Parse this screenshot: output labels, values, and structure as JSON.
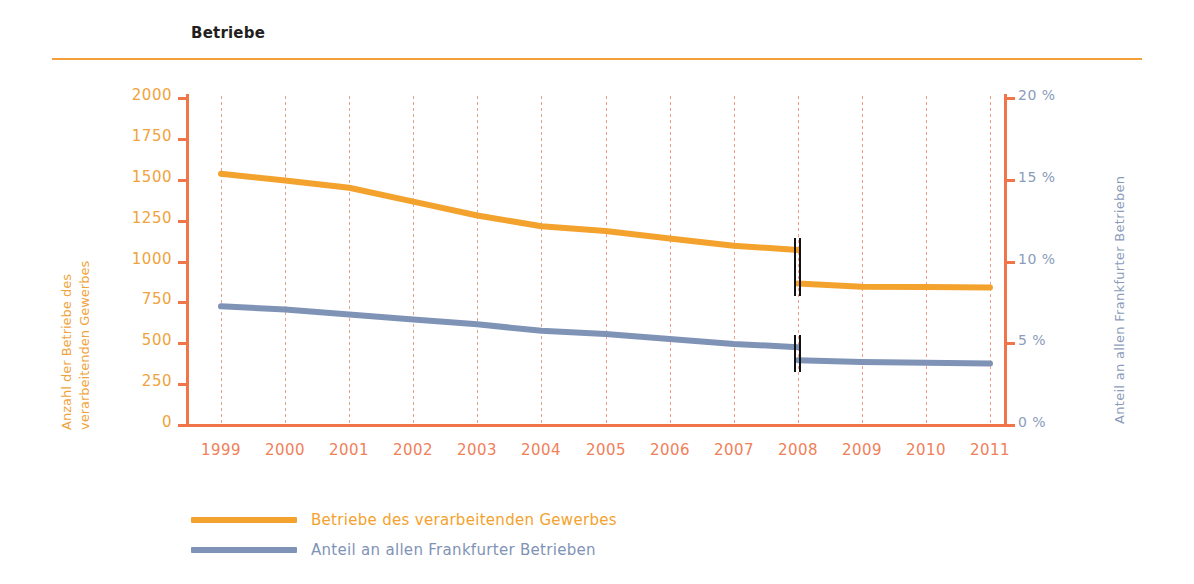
{
  "header": {
    "title": "Betriebe"
  },
  "colors": {
    "orange": "#f4a22e",
    "blue": "#7f93b7",
    "axis": "#f0764a",
    "grid": "#eaa08a",
    "rule": "#f3a03a",
    "title_text": "#231f20"
  },
  "axes": {
    "left_title_line1": "Anzahl der Betriebe des",
    "left_title_line2": "verarbeitenden Gewerbes",
    "right_title": "Anteil an allen Frankfurter Betrieben",
    "left_ticks": [
      "2000",
      "1750",
      "1500",
      "1250",
      "1000",
      "750",
      "500",
      "250",
      "0"
    ],
    "right_ticks": [
      "20 %",
      "15 %",
      "10 %",
      "5 %",
      "0 %"
    ],
    "x_ticks": [
      "1999",
      "2000",
      "2001",
      "2002",
      "2003",
      "2004",
      "2005",
      "2006",
      "2007",
      "2008",
      "2009",
      "2010",
      "2011"
    ]
  },
  "legend": {
    "items": [
      {
        "label": "Betriebe des verarbeitenden Gewerbes",
        "color": "#f4a22e"
      },
      {
        "label": "Anteil an allen Frankfurter Betrieben",
        "color": "#7f93b7"
      }
    ]
  },
  "chart_data": {
    "type": "line",
    "title": "Betriebe",
    "xlabel": "",
    "ylabel": "Anzahl der Betriebe des verarbeitenden Gewerbes",
    "y2label": "Anteil an allen Frankfurter Betrieben",
    "x": [
      1999,
      2000,
      2001,
      2002,
      2003,
      2004,
      2005,
      2006,
      2007,
      2008,
      2009,
      2010,
      2011
    ],
    "ylim": [
      0,
      2000
    ],
    "y2lim": [
      0,
      20
    ],
    "grid": "vertical-dotted",
    "legend_position": "bottom-left",
    "annotations": [
      {
        "type": "series-break",
        "at_x": 2008,
        "note": "Doppelte senkrechte Linie: Bruch in der Zeitreihe bei 2008"
      }
    ],
    "series": [
      {
        "name": "Betriebe des verarbeitenden Gewerbes",
        "color": "#f4a22e",
        "axis": "left",
        "unit": "Anzahl",
        "values": [
          1530,
          1490,
          1445,
          1360,
          1275,
          1210,
          1180,
          1135,
          1090,
          1065,
          null,
          null,
          null
        ],
        "values_after_break": [
          null,
          null,
          null,
          null,
          null,
          null,
          null,
          null,
          null,
          860,
          840,
          838,
          835
        ]
      },
      {
        "name": "Anteil an allen Frankfurter Betrieben",
        "color": "#7f93b7",
        "axis": "right",
        "unit": "%",
        "values": [
          7.2,
          7.0,
          6.7,
          6.4,
          6.1,
          5.7,
          5.5,
          5.2,
          4.9,
          4.7,
          null,
          null,
          null
        ],
        "values_after_break": [
          null,
          null,
          null,
          null,
          null,
          null,
          null,
          null,
          null,
          3.9,
          3.8,
          3.75,
          3.7
        ]
      }
    ]
  }
}
